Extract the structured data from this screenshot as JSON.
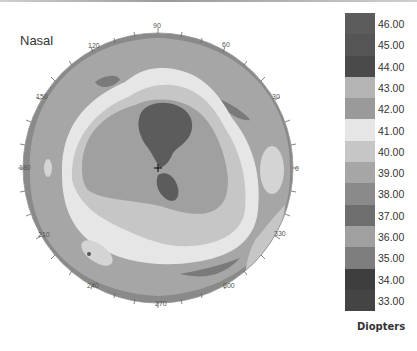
{
  "title": "Nasal",
  "legend": {
    "unit": "Diopters",
    "items": [
      {
        "label": "46.00",
        "color": "#5c5c5c"
      },
      {
        "label": "45.00",
        "color": "#555555"
      },
      {
        "label": "44.00",
        "color": "#4a4a4a"
      },
      {
        "label": "43.00",
        "color": "#b4b4b4"
      },
      {
        "label": "42.00",
        "color": "#9a9a9a"
      },
      {
        "label": "41.00",
        "color": "#e6e6e6"
      },
      {
        "label": "40.00",
        "color": "#c6c6c6"
      },
      {
        "label": "39.00",
        "color": "#a6a6a6"
      },
      {
        "label": "38.00",
        "color": "#8a8a8a"
      },
      {
        "label": "37.00",
        "color": "#6e6e6e"
      },
      {
        "label": "36.00",
        "color": "#a0a0a0"
      },
      {
        "label": "35.00",
        "color": "#7e7e7e"
      },
      {
        "label": "34.00",
        "color": "#3e3e3e"
      },
      {
        "label": "33.00",
        "color": "#444444"
      }
    ]
  },
  "angles": [
    "0",
    "30",
    "60",
    "90",
    "120",
    "150",
    "180",
    "210",
    "240",
    "270",
    "300",
    "330"
  ],
  "chart_data": {
    "type": "heatmap",
    "title": "Nasal",
    "subtype": "corneal topography polar map",
    "colorbar_label": "Diopters",
    "colorbar_ticks": [
      46.0,
      45.0,
      44.0,
      43.0,
      42.0,
      41.0,
      40.0,
      39.0,
      38.0,
      37.0,
      36.0,
      35.0,
      34.0,
      33.0
    ],
    "angular_axis_deg": [
      0,
      30,
      60,
      90,
      120,
      150,
      180,
      210,
      240,
      270,
      300,
      330
    ],
    "regions": [
      {
        "zone": "central steep island (above center)",
        "approx_diopters": 44.0
      },
      {
        "zone": "inferior lobe below center",
        "approx_diopters": 44.0
      },
      {
        "zone": "central plateau",
        "approx_diopters": 42.0
      },
      {
        "zone": "mid-peripheral ring",
        "approx_diopters": 41.0
      },
      {
        "zone": "outer ring",
        "approx_diopters": 39.0
      },
      {
        "zone": "periphery",
        "approx_diopters": 38.0
      },
      {
        "zone": "peripheral islands at 0 and 225 deg",
        "approx_diopters": 41.0
      }
    ]
  }
}
